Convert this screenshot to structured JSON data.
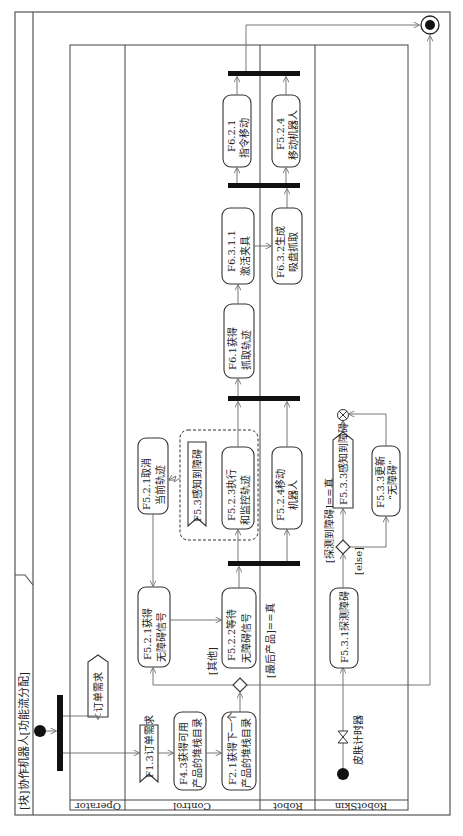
{
  "diagram": {
    "title": "[块]协作机器人[功能流分配]",
    "orientation": "rotated 90 degrees counter-clockwise",
    "lanes": [
      {
        "id": "operator",
        "label": "Operator"
      },
      {
        "id": "control",
        "label": "Control"
      },
      {
        "id": "robot",
        "label": "Robot"
      },
      {
        "id": "robotskin",
        "label": "RobotSkin"
      }
    ],
    "nodes": {
      "order_signal": "订单需求",
      "f13": "F1.3订单需求",
      "f43_l1": "F4.3获得可用",
      "f43_l2": "产品的堆栈目录",
      "f21_l1": "F2.1获得下一个",
      "f21_l2": "产品的堆栈目录",
      "f521_l1": "F5.2.1获得",
      "f521_l2": "无障碍信号",
      "f522_l1": "F5.2.2等待",
      "f522_l2": "无障碍信号",
      "f521c_l1": "F5.2.1取消",
      "f521c_l2": "当前轨迹",
      "f53": "F5.3感知到障碍",
      "f523_l1": "F5.2.3执行",
      "f523_l2": "和监控轨迹",
      "f524a_l1": "F5.2.4移动",
      "f524a_l2": "机器人",
      "f61_l1": "F6.1获得",
      "f61_l2": "抓取轨迹",
      "f6311_l1": "F6.3.1.1",
      "f6311_l2": "激活夹具",
      "f632_l1": "F6.3.2生成",
      "f632_l2": "吸盘抓取",
      "f621_l1": "F6.2.1",
      "f621_l2": "指令移动",
      "f524b_l1": "F5.2.4",
      "f524b_l2": "移动机器人",
      "f531": "F5.3.1探测障碍",
      "f533": "F5.3.3感知到障碍",
      "f533u_l1": "F5.3.3更新",
      "f533u_l2": "“无障碍”",
      "timer": "皮肤计时器"
    },
    "guards": {
      "other": "[其他]",
      "last_product": "[最后产品]==真",
      "obstacle_true": "[探测到障碍]==真",
      "else": "[else]"
    }
  }
}
